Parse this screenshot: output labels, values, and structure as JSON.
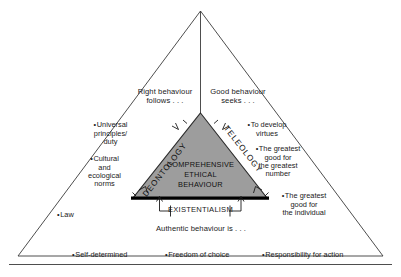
{
  "figure": {
    "title_inner": "COMPREHENSIVE\nETHICAL\nBEHAVIOUR",
    "colors": {
      "inner_fill": "#9d9d9d",
      "stroke": "#333333",
      "base_stroke": "#000000",
      "text": "#1a1a1a",
      "background": "#ffffff"
    },
    "edge_labels": {
      "left": "DEONTOLOGY",
      "right": "TELEOLOGY",
      "bottom": "EXISTENTIALISM"
    },
    "branches": {
      "deontology": {
        "heading": "Right behaviour\nfollows . . .",
        "items": [
          "Universal\nprinciples/\nduty",
          "Cultural\nand\necological\nnorms",
          "Law"
        ]
      },
      "teleology": {
        "heading": "Good behaviour\nseeks . . .",
        "items": [
          "To develop\nvirtues",
          "The greatest\ngood for\nthe greatest\nnumber",
          "The greatest\ngood for\nthe individual"
        ]
      },
      "existentialism": {
        "heading": "Authentic behaviour is . . .",
        "items": [
          "Self-determined",
          "Freedom of choice",
          "Responsibility for action"
        ]
      }
    }
  }
}
